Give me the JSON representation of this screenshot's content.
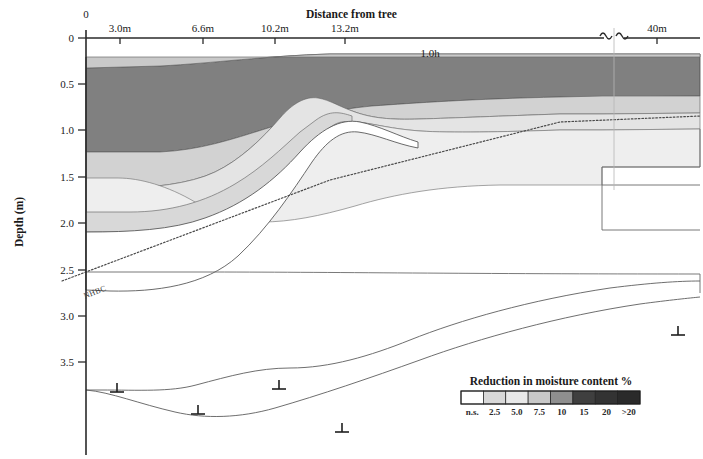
{
  "figure": {
    "top_cropped_caption": "",
    "x_axis": {
      "title": "Distance from tree",
      "ticks": [
        {
          "label": "0",
          "value": 0,
          "x": 86
        },
        {
          "label": "3.0m",
          "value": 3.0,
          "x": 120
        },
        {
          "label": "6.6m",
          "value": 6.6,
          "x": 203
        },
        {
          "label": "10.2m",
          "value": 10.2,
          "x": 275
        },
        {
          "label": "13.2m",
          "value": 13.2,
          "x": 345
        },
        {
          "label": "40m",
          "value": 40.0,
          "x": 657
        }
      ],
      "break_symbol": "~",
      "annotation": {
        "label": "1.0h",
        "x": 430
      }
    },
    "y_axis": {
      "title": "Depth (m)",
      "ticks": [
        {
          "label": "0",
          "value": 0.0,
          "y": 38
        },
        {
          "label": "0.5",
          "value": 0.5,
          "y": 84
        },
        {
          "label": "1.0",
          "value": 1.0,
          "y": 130
        },
        {
          "label": "1.5",
          "value": 1.5,
          "y": 177
        },
        {
          "label": "2.0",
          "value": 2.0,
          "y": 223
        },
        {
          "label": "2.5",
          "value": 2.5,
          "y": 270
        },
        {
          "label": "3.0",
          "value": 3.0,
          "y": 316
        },
        {
          "label": "3.5",
          "value": 3.5,
          "y": 362
        }
      ]
    },
    "nhbc_line": {
      "label": "NHBC",
      "style": "dotted"
    },
    "legend": {
      "title": "Reduction in moisture content %",
      "x_start": 461,
      "x_end": 640,
      "y_top": 391,
      "y_bottom": 404,
      "entries": [
        {
          "label": "n.s.",
          "color": "#ffffff"
        },
        {
          "label": "2.5",
          "color": "#d8d8d8"
        },
        {
          "label": "5.0",
          "color": "#e8e8e8"
        },
        {
          "label": "7.5",
          "color": "#c8c8c8"
        },
        {
          "label": "10",
          "color": "#8f8f8f"
        },
        {
          "label": "15",
          "color": "#3f3f3f"
        },
        {
          "label": "20",
          "color": "#333333"
        },
        {
          "label": ">20",
          "color": "#2a2a2a"
        }
      ]
    },
    "boreholes": [
      {
        "x": 117,
        "y": 390
      },
      {
        "x": 198,
        "y": 412
      },
      {
        "x": 279,
        "y": 387
      },
      {
        "x": 342,
        "y": 430
      },
      {
        "x": 678,
        "y": 333
      }
    ]
  },
  "chart_data": {
    "type": "contour-cross-section",
    "title": "Reduction in moisture content %",
    "xlabel": "Distance from tree",
    "ylabel": "Depth (m)",
    "xlim": [
      0,
      40
    ],
    "ylim": [
      0,
      3.8
    ],
    "y_inverted": true,
    "grid": false,
    "legend_position": "bottom-right",
    "band_levels": [
      "n.s.",
      "2.5",
      "5.0",
      "7.5",
      "10",
      "15",
      "20",
      ">20"
    ],
    "band_colors": [
      "#ffffff",
      "#d8d8d8",
      "#e8e8e8",
      "#c8c8c8",
      "#8f8f8f",
      "#3f3f3f",
      "#333333",
      "#2a2a2a"
    ],
    "notes": [
      "Soil moisture deficit cross-section adjacent to a tree.",
      "Greatest reduction (darkest band, 15-20%) occurs near the tree at 0-3 m distance, 0.25-1.25 m depth.",
      "Reduction diminishes with distance from tree; beyond ~13 m only the 2.5-7.5% bands persist.",
      "Dotted NHBC line rises from 2.55 m depth at the tree to ~0.78 m depth at 40 m.",
      "Axis break between 13.2 m and 40 m indicated by tilde symbols."
    ],
    "depth_profile_at_tree_m": {
      "top_of_affected_zone": 0.25,
      "band_boundaries": [
        0.25,
        0.37,
        1.0,
        1.27,
        1.92,
        2.12,
        2.76
      ]
    },
    "nhbc_line_points": [
      [
        0,
        2.55
      ],
      [
        13.2,
        1.35
      ],
      [
        26,
        0.9
      ],
      [
        40,
        0.78
      ]
    ],
    "influence_extent_m": 40
  }
}
